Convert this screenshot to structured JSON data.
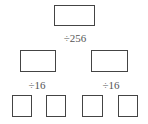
{
  "diagram": {
    "levels": [
      {
        "boxes": 1,
        "label": "÷256"
      },
      {
        "boxes": 2,
        "labels": [
          "÷16",
          "÷16"
        ]
      },
      {
        "boxes": 4
      }
    ],
    "top_label": "÷256",
    "mid_labels": [
      "÷16",
      "÷16"
    ]
  }
}
